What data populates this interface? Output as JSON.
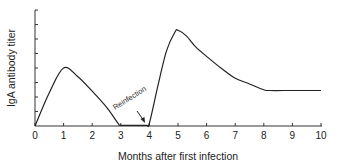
{
  "chart_data": {
    "type": "line",
    "title": "",
    "xlabel": "Months after first infection",
    "ylabel": "IgA antibody titer",
    "xlim": [
      0,
      10
    ],
    "ylim": [
      0,
      8
    ],
    "xticks": [
      "0",
      "1",
      "2",
      "3",
      "4",
      "5",
      "6",
      "7",
      "8",
      "9",
      "10"
    ],
    "yticks_count": 8,
    "y_tick_labels_visible": false,
    "grid": false,
    "legend": null,
    "series": [
      {
        "name": "IgA antibody titer",
        "x": [
          0,
          0.5,
          1.0,
          1.5,
          2.0,
          2.5,
          2.9,
          3.0,
          3.5,
          3.9,
          4.0,
          4.3,
          4.6,
          4.9,
          5.0,
          5.3,
          5.6,
          6.0,
          6.5,
          7.0,
          7.5,
          8.0,
          8.2,
          9.0,
          10.0
        ],
        "y": [
          0,
          2.3,
          4.0,
          3.4,
          2.4,
          1.3,
          0.2,
          0.05,
          0.05,
          0.05,
          0.2,
          2.8,
          5.2,
          6.5,
          6.6,
          6.2,
          5.5,
          4.8,
          4.0,
          3.3,
          2.9,
          2.5,
          2.45,
          2.45,
          2.45
        ]
      }
    ],
    "annotations": [
      {
        "text": "Reinfection",
        "x": 3.5,
        "y": 1.2,
        "arrow_to": [
          3.95,
          0.2
        ]
      }
    ]
  },
  "labels": {
    "xlabel": "Months after first infection",
    "ylabel": "IgA antibody titer",
    "annotation": "Reinfection",
    "xticks": [
      "0",
      "1",
      "2",
      "3",
      "4",
      "5",
      "6",
      "7",
      "8",
      "9",
      "10"
    ]
  }
}
